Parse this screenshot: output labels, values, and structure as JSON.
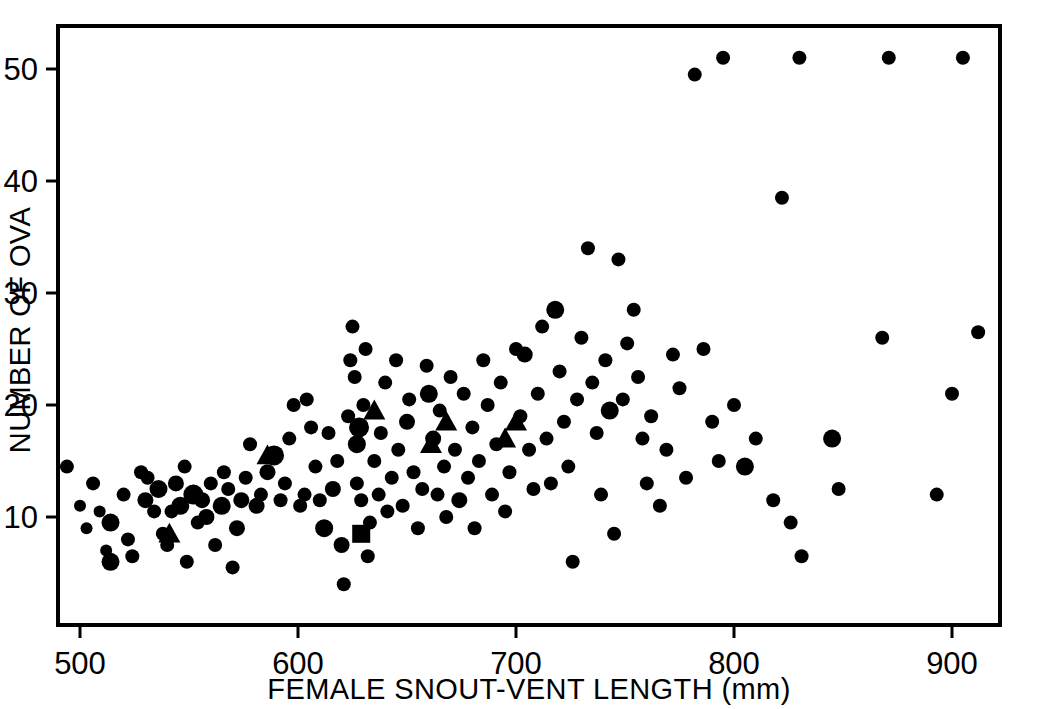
{
  "chart_data": {
    "type": "scatter",
    "title": "",
    "xlabel": "FEMALE SNOUT-VENT LENGTH (mm)",
    "ylabel": "NUMBER OF OVA",
    "xlim": [
      490,
      918
    ],
    "ylim": [
      0,
      54
    ],
    "xticks": [
      500,
      600,
      700,
      800,
      900
    ],
    "xtick_labels": [
      "500",
      "600",
      "700",
      "800",
      "900"
    ],
    "yticks": [
      10,
      20,
      30,
      40,
      50
    ],
    "ytick_labels": [
      "10",
      "20",
      "30",
      "40",
      "50"
    ],
    "grid": false,
    "legend": "none",
    "marker_color": "#000000",
    "series": [
      {
        "name": "circles",
        "marker": "circle",
        "points": [
          [
            494,
            14.5,
            7
          ],
          [
            500,
            11.0,
            6
          ],
          [
            503,
            9.0,
            6
          ],
          [
            506,
            13.0,
            7
          ],
          [
            509,
            10.5,
            6
          ],
          [
            512,
            7.0,
            6
          ],
          [
            514,
            9.5,
            9
          ],
          [
            514,
            6.0,
            9
          ],
          [
            520,
            12.0,
            7
          ],
          [
            522,
            8.0,
            7
          ],
          [
            524,
            6.5,
            7
          ],
          [
            528,
            14.0,
            7
          ],
          [
            530,
            11.5,
            8
          ],
          [
            531,
            13.5,
            7
          ],
          [
            534,
            10.5,
            7
          ],
          [
            536,
            12.5,
            9
          ],
          [
            538,
            8.5,
            7
          ],
          [
            540,
            7.5,
            7
          ],
          [
            542,
            10.5,
            7
          ],
          [
            544,
            13.0,
            8
          ],
          [
            546,
            11.0,
            9
          ],
          [
            548,
            14.5,
            7
          ],
          [
            549,
            6.0,
            7
          ],
          [
            552,
            12.0,
            10
          ],
          [
            554,
            9.5,
            7
          ],
          [
            556,
            11.5,
            8
          ],
          [
            558,
            10.0,
            8
          ],
          [
            560,
            13.0,
            7
          ],
          [
            562,
            7.5,
            7
          ],
          [
            565,
            11.0,
            9
          ],
          [
            566,
            14.0,
            7
          ],
          [
            568,
            12.5,
            7
          ],
          [
            570,
            5.5,
            7
          ],
          [
            572,
            9.0,
            8
          ],
          [
            574,
            11.5,
            8
          ],
          [
            576,
            13.5,
            7
          ],
          [
            578,
            16.5,
            7
          ],
          [
            581,
            11.0,
            8
          ],
          [
            583,
            12.0,
            7
          ],
          [
            586,
            14.0,
            8
          ],
          [
            589,
            15.5,
            10
          ],
          [
            592,
            11.5,
            7
          ],
          [
            594,
            13.0,
            7
          ],
          [
            596,
            17.0,
            7
          ],
          [
            598,
            20.0,
            7
          ],
          [
            601,
            11.0,
            7
          ],
          [
            603,
            12.0,
            7
          ],
          [
            604,
            20.5,
            7
          ],
          [
            606,
            18.0,
            7
          ],
          [
            608,
            14.5,
            7
          ],
          [
            610,
            11.5,
            7
          ],
          [
            612,
            9.0,
            9
          ],
          [
            614,
            17.5,
            7
          ],
          [
            616,
            12.5,
            8
          ],
          [
            618,
            15.0,
            7
          ],
          [
            620,
            7.5,
            8
          ],
          [
            621,
            4.0,
            7
          ],
          [
            623,
            19.0,
            7
          ],
          [
            624,
            24.0,
            7
          ],
          [
            625,
            27.0,
            7
          ],
          [
            626,
            22.5,
            7
          ],
          [
            627,
            16.5,
            9
          ],
          [
            627,
            13.0,
            7
          ],
          [
            628,
            18.0,
            10
          ],
          [
            629,
            11.5,
            7
          ],
          [
            630,
            20.0,
            7
          ],
          [
            631,
            25.0,
            7
          ],
          [
            632,
            6.5,
            7
          ],
          [
            633,
            9.5,
            7
          ],
          [
            635,
            15.0,
            7
          ],
          [
            637,
            12.0,
            7
          ],
          [
            638,
            17.5,
            7
          ],
          [
            640,
            22.0,
            7
          ],
          [
            641,
            10.5,
            7
          ],
          [
            643,
            13.5,
            7
          ],
          [
            645,
            24.0,
            7
          ],
          [
            646,
            16.0,
            7
          ],
          [
            648,
            11.0,
            7
          ],
          [
            650,
            18.5,
            8
          ],
          [
            651,
            20.5,
            7
          ],
          [
            653,
            14.0,
            7
          ],
          [
            655,
            9.0,
            7
          ],
          [
            657,
            12.5,
            7
          ],
          [
            659,
            23.5,
            7
          ],
          [
            660,
            21.0,
            9
          ],
          [
            662,
            17.0,
            8
          ],
          [
            664,
            12.0,
            7
          ],
          [
            665,
            19.5,
            7
          ],
          [
            667,
            14.5,
            7
          ],
          [
            668,
            10.0,
            7
          ],
          [
            670,
            22.5,
            7
          ],
          [
            672,
            16.0,
            7
          ],
          [
            674,
            11.5,
            8
          ],
          [
            676,
            21.0,
            7
          ],
          [
            678,
            13.5,
            7
          ],
          [
            680,
            18.0,
            7
          ],
          [
            681,
            9.0,
            7
          ],
          [
            683,
            15.0,
            7
          ],
          [
            685,
            24.0,
            7
          ],
          [
            687,
            20.0,
            7
          ],
          [
            689,
            12.0,
            7
          ],
          [
            691,
            16.5,
            7
          ],
          [
            693,
            22.0,
            7
          ],
          [
            695,
            10.5,
            7
          ],
          [
            697,
            14.0,
            7
          ],
          [
            700,
            25.0,
            7
          ],
          [
            702,
            19.0,
            7
          ],
          [
            704,
            24.5,
            8
          ],
          [
            706,
            16.0,
            7
          ],
          [
            708,
            12.5,
            7
          ],
          [
            710,
            21.0,
            7
          ],
          [
            712,
            27.0,
            7
          ],
          [
            714,
            17.0,
            7
          ],
          [
            716,
            13.0,
            7
          ],
          [
            718,
            28.5,
            9
          ],
          [
            720,
            23.0,
            7
          ],
          [
            722,
            18.5,
            7
          ],
          [
            724,
            14.5,
            7
          ],
          [
            726,
            6.0,
            7
          ],
          [
            728,
            20.5,
            7
          ],
          [
            730,
            26.0,
            7
          ],
          [
            733,
            34.0,
            7
          ],
          [
            735,
            22.0,
            7
          ],
          [
            737,
            17.5,
            7
          ],
          [
            739,
            12.0,
            7
          ],
          [
            741,
            24.0,
            7
          ],
          [
            743,
            19.5,
            9
          ],
          [
            745,
            8.5,
            7
          ],
          [
            747,
            33.0,
            7
          ],
          [
            749,
            20.5,
            7
          ],
          [
            751,
            25.5,
            7
          ],
          [
            754,
            28.5,
            7
          ],
          [
            756,
            22.5,
            7
          ],
          [
            758,
            17.0,
            7
          ],
          [
            760,
            13.0,
            7
          ],
          [
            762,
            19.0,
            7
          ],
          [
            766,
            11.0,
            7
          ],
          [
            769,
            16.0,
            7
          ],
          [
            772,
            24.5,
            7
          ],
          [
            775,
            21.5,
            7
          ],
          [
            778,
            13.5,
            7
          ],
          [
            782,
            49.5,
            7
          ],
          [
            786,
            25.0,
            7
          ],
          [
            790,
            18.5,
            7
          ],
          [
            793,
            15.0,
            7
          ],
          [
            795,
            51.0,
            7
          ],
          [
            800,
            20.0,
            7
          ],
          [
            805,
            14.5,
            9
          ],
          [
            810,
            17.0,
            7
          ],
          [
            818,
            11.5,
            7
          ],
          [
            822,
            38.5,
            7
          ],
          [
            826,
            9.5,
            7
          ],
          [
            830,
            51.0,
            7
          ],
          [
            831,
            6.5,
            7
          ],
          [
            845,
            17.0,
            9
          ],
          [
            848,
            12.5,
            7
          ],
          [
            868,
            26.0,
            7
          ],
          [
            871,
            51.0,
            7
          ],
          [
            893,
            12.0,
            7
          ],
          [
            900,
            21.0,
            7
          ],
          [
            905,
            51.0,
            7
          ],
          [
            912,
            26.5,
            7
          ]
        ]
      },
      {
        "name": "triangles",
        "marker": "triangle",
        "points": [
          [
            541,
            8.5
          ],
          [
            586,
            15.5
          ],
          [
            635,
            19.5
          ],
          [
            668,
            18.5
          ],
          [
            661,
            16.5
          ],
          [
            700,
            18.5
          ],
          [
            695,
            17.0
          ]
        ]
      },
      {
        "name": "squares",
        "marker": "square",
        "points": [
          [
            629,
            8.5
          ]
        ]
      }
    ]
  },
  "axis": {
    "x_title": "FEMALE SNOUT-VENT LENGTH (mm)",
    "y_title": "NUMBER OF OVA",
    "x_tick_labels": [
      "500",
      "600",
      "700",
      "800",
      "900"
    ],
    "y_tick_labels": [
      "10",
      "20",
      "30",
      "40",
      "50"
    ]
  }
}
